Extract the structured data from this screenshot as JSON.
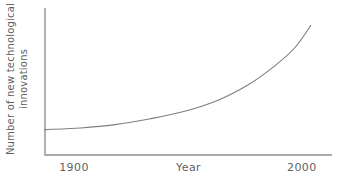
{
  "colors": {
    "background": "#ffffff",
    "axis": "#8f8f8f",
    "curve": "#7f7f7f",
    "text": "#5f5f5f"
  },
  "chart_data": {
    "type": "line",
    "title": "",
    "xlabel": "Year",
    "ylabel": "Number of new technological innovations",
    "ylabel_lines": [
      "Number of new technological",
      "innovations"
    ],
    "grid": false,
    "legend": false,
    "x_range_years": [
      1887,
      2013
    ],
    "y_axis_labeled": false,
    "x_ticks": [
      {
        "label": "1900",
        "year": 1900,
        "axis_frac": 0.101
      },
      {
        "label": "2000",
        "year": 2000,
        "axis_frac": 0.895
      }
    ],
    "series": [
      {
        "name": "technological-innovations",
        "points_year_value": [
          [
            1887,
            0.173
          ],
          [
            1903,
            0.184
          ],
          [
            1918,
            0.207
          ],
          [
            1933,
            0.245
          ],
          [
            1949,
            0.299
          ],
          [
            1964,
            0.378
          ],
          [
            1977,
            0.483
          ],
          [
            1988,
            0.605
          ],
          [
            1997,
            0.731
          ],
          [
            2004,
            0.884
          ]
        ]
      }
    ]
  }
}
